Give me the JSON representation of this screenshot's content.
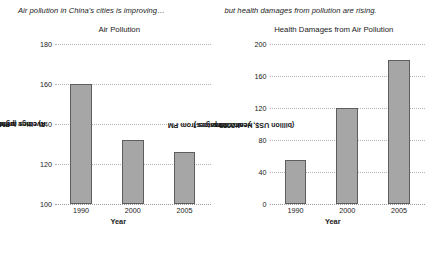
{
  "figure": {
    "panels": [
      {
        "caption": "Air pollution in China's cities is improving…",
        "title": "Air Pollution",
        "ylabel_line1": "Average annual exposure levels of",
        "ylabel_line2_pre": "PM",
        "ylabel_line2_sub": "10",
        "ylabel_line2_post": " in cities (µg/m",
        "ylabel_line2_sup": "3",
        "ylabel_line2_end": ")",
        "xlabel": "Year"
      },
      {
        "caption": "but health damages from pollution are rising.",
        "title": "Health Damages from Air Pollution",
        "ylabel_line1_pre": "Health damages from PM",
        "ylabel_line1_sub": "10",
        "ylabel_line1_post": " in cities",
        "ylabel_line2": "(billion US$, year 2005 prices)",
        "xlabel": "Year"
      }
    ]
  },
  "chart_data": [
    {
      "type": "bar",
      "title": "Air Pollution",
      "subtitle": "Air pollution in China's cities is improving…",
      "categories": [
        "1990",
        "2000",
        "2005"
      ],
      "values": [
        160,
        132,
        126
      ],
      "xlabel": "Year",
      "ylabel": "Average annual exposure levels of PM10 in cities (µg/m3)",
      "ylim": [
        100,
        180
      ],
      "yticks": [
        100,
        120,
        140,
        160,
        180
      ],
      "ytick_labels": [
        "100",
        "120",
        "140",
        "160",
        "180"
      ],
      "grid": true,
      "legend": "none",
      "bar_color": "#a6a6a6",
      "bar_edge_color": "#5e5e5e"
    },
    {
      "type": "bar",
      "title": "Health Damages from Air Pollution",
      "subtitle": "but health damages from pollution are rising.",
      "categories": [
        "1990",
        "2000",
        "2005"
      ],
      "values": [
        55,
        120,
        180
      ],
      "xlabel": "Year",
      "ylabel": "Health damages from PM10 in cities (billion US$, year 2005 prices)",
      "ylim": [
        0,
        200
      ],
      "yticks": [
        0,
        40,
        80,
        120,
        160,
        200
      ],
      "ytick_labels": [
        "0",
        "40",
        "80",
        "120",
        "160",
        "200"
      ],
      "grid": true,
      "legend": "none",
      "bar_color": "#a6a6a6",
      "bar_edge_color": "#5e5e5e"
    }
  ]
}
